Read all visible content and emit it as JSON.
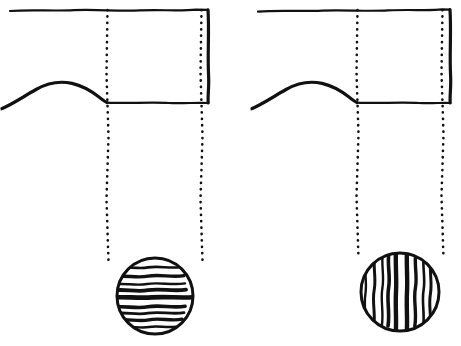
{
  "figure": {
    "width": 461,
    "height": 346,
    "background_color": "#ffffff",
    "ink_color": "#111111",
    "style": "hand-drawn pen and ink line diagram",
    "panel_count": 2
  },
  "panels": [
    {
      "id": "left-panel",
      "name": "left-panel",
      "sphere_band_orientation": "horizontal",
      "box": {
        "x_left": 10,
        "x_right": 208,
        "y_top": 10,
        "y_bottom": 102
      },
      "curve": {
        "description": "rising then falling profile curve entering from left edge and meeting the horizontal baseline",
        "start": [
          2,
          108
        ],
        "peak": [
          70,
          83
        ],
        "end": [
          107,
          102
        ]
      },
      "dotted_lines": [
        {
          "name": "left-projection-line",
          "x": 107,
          "y_top": 10,
          "y_bottom": 262
        },
        {
          "name": "right-projection-line",
          "x": 201,
          "y_top": 10,
          "y_bottom": 262
        }
      ],
      "sphere": {
        "cx": 155,
        "cy": 296,
        "r": 38,
        "bands": 9
      }
    },
    {
      "id": "right-panel",
      "name": "right-panel",
      "sphere_band_orientation": "vertical",
      "box": {
        "x_left": 258,
        "x_right": 450,
        "y_top": 10,
        "y_bottom": 102
      },
      "curve": {
        "description": "rising then falling profile curve entering from left edge and meeting the horizontal baseline",
        "start": [
          252,
          108
        ],
        "peak": [
          320,
          83
        ],
        "end": [
          357,
          102
        ]
      },
      "dotted_lines": [
        {
          "name": "left-projection-line",
          "x": 357,
          "y_top": 10,
          "y_bottom": 258
        },
        {
          "name": "right-projection-line",
          "x": 442,
          "y_top": 10,
          "y_bottom": 258
        }
      ],
      "sphere": {
        "cx": 400,
        "cy": 292,
        "r": 39,
        "bands": 9
      }
    }
  ],
  "chart_data": {
    "type": "line",
    "title": "",
    "xlabel": "",
    "ylabel": "",
    "grid": false,
    "legend": null,
    "annotations": [
      "Left panel: sphere rendered with horizontal banding",
      "Right panel: sphere rendered with vertical banding",
      "Dotted vertical lines project box edges down onto each sphere"
    ],
    "series": [
      {
        "name": "left-profile-curve",
        "x": [
          2,
          14,
          28,
          44,
          58,
          70,
          82,
          92,
          100,
          107
        ],
        "y": [
          108,
          99,
          91,
          86,
          84,
          83,
          85,
          90,
          97,
          102
        ]
      },
      {
        "name": "right-profile-curve",
        "x": [
          252,
          264,
          278,
          294,
          308,
          320,
          332,
          342,
          350,
          357
        ],
        "y": [
          108,
          99,
          91,
          86,
          84,
          83,
          85,
          90,
          97,
          102
        ]
      }
    ]
  }
}
